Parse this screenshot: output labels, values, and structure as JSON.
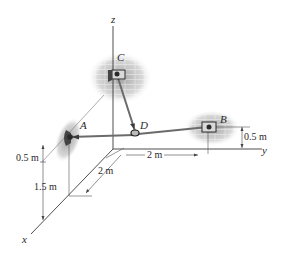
{
  "figure": {
    "axes": {
      "x": "x",
      "y": "y",
      "z": "z"
    },
    "points": {
      "A": "A",
      "B": "B",
      "C": "C",
      "D": "D"
    },
    "dimensions": {
      "dim_A_height_top": "0.5 m",
      "dim_A_height_bottom": "1.5 m",
      "dim_x_offset": "2 m",
      "dim_y_offset": "2 m",
      "dim_B_height": "0.5 m"
    },
    "colors": {
      "line": "#3a3a3a",
      "cable": "#6b6b6b",
      "wall": "#b8b8b8",
      "bracket": "#2a2a2a"
    }
  }
}
